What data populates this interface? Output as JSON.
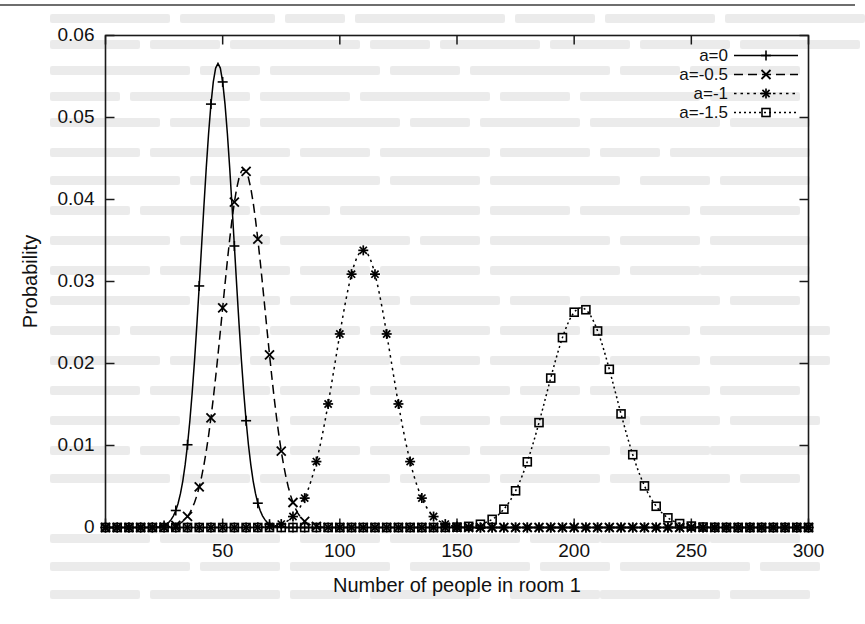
{
  "figure": {
    "type": "line-chart-scan",
    "top_rule": true
  },
  "axes": {
    "x": {
      "label": "Number of people in room 1",
      "min": 0,
      "max": 300,
      "ticks": [
        0,
        50,
        100,
        150,
        200,
        250,
        300
      ],
      "tick_labels": [
        "0",
        "50",
        "100",
        "150",
        "200",
        "250",
        "300"
      ],
      "first_tick_label_hidden": true
    },
    "y": {
      "label": "Probability",
      "min": 0,
      "max": 0.06,
      "ticks": [
        0,
        0.01,
        0.02,
        0.03,
        0.04,
        0.05,
        0.06
      ],
      "tick_labels": [
        "0",
        "0.01",
        "0.02",
        "0.03",
        "0.04",
        "0.05",
        "0.06"
      ]
    }
  },
  "legend": {
    "position": "top-right-inside",
    "entries": [
      {
        "label": "a=0",
        "marker": "plus",
        "dash": "none"
      },
      {
        "label": "a=-0.5",
        "marker": "cross",
        "dash": "dashed"
      },
      {
        "label": "a=-1",
        "marker": "star",
        "dash": "dotted"
      },
      {
        "label": "a=-1.5",
        "marker": "square",
        "dash": "dashdot"
      }
    ]
  },
  "chart_data": {
    "type": "line",
    "title": "",
    "xlabel": "Number of people in room 1",
    "ylabel": "Probability",
    "xlim": [
      0,
      300
    ],
    "ylim": [
      0,
      0.06
    ],
    "xticks": [
      0,
      50,
      100,
      150,
      200,
      250,
      300
    ],
    "yticks": [
      0,
      0.01,
      0.02,
      0.03,
      0.04,
      0.05,
      0.06
    ],
    "grid": false,
    "legend_position": "top right inside",
    "marker_step": 5,
    "series": [
      {
        "name": "a=0",
        "marker": "plus",
        "dash": "none",
        "color": "#000000",
        "peak_x": 48,
        "peak_y": 0.0566,
        "sigma": 7.0,
        "x": [
          0,
          5,
          10,
          15,
          20,
          25,
          30,
          35,
          40,
          45,
          50,
          55,
          60,
          65,
          70,
          75,
          80,
          85,
          90,
          95,
          100,
          105,
          110,
          115,
          120,
          125,
          130,
          135,
          140,
          145,
          150,
          155,
          160,
          165,
          170,
          175,
          180,
          185,
          190,
          195,
          200,
          210,
          220,
          230,
          240,
          250,
          260,
          270,
          280,
          290,
          300
        ],
        "y": [
          0.0,
          0.0,
          0.0,
          0.0,
          1e-05,
          0.00021,
          0.0018,
          0.00824,
          0.0236,
          0.04552,
          0.05607,
          0.04333,
          0.0216,
          0.0074,
          0.0018,
          0.00032,
          4e-05,
          0.0,
          0.0,
          0.0,
          0.0,
          0.0,
          0.0,
          0.0,
          0.0,
          0.0,
          0.0,
          0.0,
          0.0,
          0.0,
          0.0,
          0.0,
          0.0,
          0.0,
          0.0,
          0.0,
          0.0,
          0.0,
          0.0,
          0.0,
          0.0,
          0.0,
          0.0,
          0.0,
          0.0,
          0.0,
          0.0,
          0.0,
          0.0,
          0.0,
          0.0
        ]
      },
      {
        "name": "a=-0.5",
        "marker": "cross",
        "dash": "dashed",
        "color": "#000000",
        "peak_x": 59,
        "peak_y": 0.0437,
        "sigma": 9.1,
        "x": [
          0,
          5,
          10,
          15,
          20,
          25,
          30,
          35,
          40,
          45,
          50,
          55,
          60,
          65,
          70,
          75,
          80,
          85,
          90,
          95,
          100,
          105,
          110,
          115,
          120,
          125,
          130,
          135,
          140,
          145,
          150,
          155,
          160,
          165,
          170,
          175,
          180,
          185,
          190,
          195,
          200,
          210,
          220,
          230,
          240,
          250,
          260,
          270,
          280,
          290,
          300
        ],
        "y": [
          0.0,
          0.0,
          0.0,
          0.0,
          0.0,
          2e-05,
          0.00025,
          0.0018,
          0.0074,
          0.0191,
          0.0328,
          0.0423,
          0.0437,
          0.0346,
          0.0211,
          0.0099,
          0.0036,
          0.001,
          0.00022,
          4e-05,
          0.0,
          0.0,
          0.0,
          0.0,
          0.0,
          0.0,
          0.0,
          0.0,
          0.0,
          0.0,
          0.0,
          0.0,
          0.0,
          0.0,
          0.0,
          0.0,
          0.0,
          0.0,
          0.0,
          0.0,
          0.0,
          0.0,
          0.0,
          0.0,
          0.0,
          0.0,
          0.0,
          0.0,
          0.0,
          0.0,
          0.0
        ]
      },
      {
        "name": "a=-1",
        "marker": "star",
        "dash": "dotted",
        "color": "#000000",
        "peak_x": 110,
        "peak_y": 0.0338,
        "sigma": 11.8,
        "x": [
          0,
          5,
          10,
          15,
          20,
          25,
          30,
          35,
          40,
          45,
          50,
          55,
          60,
          65,
          70,
          75,
          80,
          85,
          90,
          95,
          100,
          105,
          110,
          115,
          120,
          125,
          130,
          135,
          140,
          145,
          150,
          155,
          160,
          165,
          170,
          175,
          180,
          185,
          190,
          195,
          200,
          210,
          220,
          230,
          240,
          250,
          260,
          270,
          280,
          290,
          300
        ],
        "y": [
          0.0,
          0.0,
          0.0,
          0.0,
          0.0,
          0.0,
          0.0,
          0.0,
          0.0,
          0.0,
          0.0,
          0.0,
          0.0,
          4e-05,
          0.00022,
          0.001,
          0.0035,
          0.0095,
          0.019,
          0.0279,
          0.033,
          0.0338,
          0.033,
          0.0279,
          0.019,
          0.0095,
          0.0035,
          0.001,
          0.00022,
          4e-05,
          0.0,
          0.0,
          0.0,
          0.0,
          0.0,
          0.0,
          0.0,
          0.0,
          0.0,
          0.0,
          0.0,
          0.0,
          0.0,
          0.0,
          0.0,
          0.0,
          0.0,
          0.0,
          0.0,
          0.0,
          0.0
        ]
      },
      {
        "name": "a=-1.5",
        "marker": "square",
        "dash": "dashdot",
        "color": "#000000",
        "peak_x": 203,
        "peak_y": 0.0268,
        "sigma": 14.8,
        "x": [
          0,
          5,
          10,
          15,
          20,
          25,
          30,
          35,
          40,
          45,
          50,
          55,
          60,
          65,
          70,
          75,
          80,
          85,
          90,
          95,
          100,
          105,
          110,
          115,
          120,
          125,
          130,
          135,
          140,
          145,
          150,
          155,
          160,
          165,
          170,
          175,
          180,
          185,
          190,
          195,
          200,
          205,
          210,
          215,
          220,
          225,
          230,
          235,
          240,
          245,
          250,
          255,
          260,
          265,
          270,
          275,
          280,
          285,
          290,
          295,
          300
        ],
        "y": [
          0.0,
          0.0,
          0.0,
          0.0,
          0.0,
          0.0,
          0.0,
          0.0,
          0.0,
          0.0,
          0.0,
          0.0,
          0.0,
          0.0,
          0.0,
          0.0,
          0.0,
          0.0,
          0.0,
          0.0,
          0.0,
          0.0,
          0.0,
          0.0,
          0.0,
          0.0,
          0.0,
          0.0,
          0.0,
          0.0,
          0.0,
          0.0,
          2e-05,
          0.00012,
          0.00055,
          0.0018,
          0.0048,
          0.0102,
          0.0175,
          0.024,
          0.0268,
          0.0264,
          0.0227,
          0.0168,
          0.0103,
          0.0052,
          0.0021,
          0.0007,
          0.00018,
          4e-05,
          1e-05,
          0.0,
          0.0,
          0.0,
          0.0,
          0.0,
          0.0,
          0.0,
          0.0,
          0.0,
          0.0
        ]
      }
    ]
  },
  "colors": {
    "ink": "#000000",
    "frame": "#1a1a1a",
    "paper": "#ffffff"
  }
}
